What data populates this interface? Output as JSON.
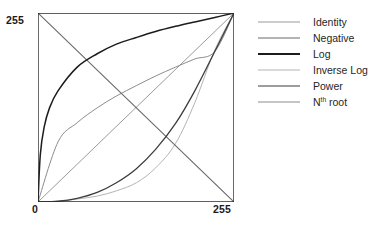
{
  "chart_data": {
    "type": "line",
    "title": "",
    "xlabel": "",
    "ylabel": "",
    "xlim": [
      0,
      255
    ],
    "ylim": [
      0,
      255
    ],
    "grid": false,
    "legend_position": "right",
    "x_ticks": [
      "0",
      "255"
    ],
    "y_ticks": [
      "255"
    ],
    "series": [
      {
        "name": "Identity",
        "color": "#9a9a9a",
        "width": 1.0,
        "formula": "y = x",
        "x": [
          0,
          26,
          51,
          77,
          102,
          128,
          153,
          179,
          204,
          230,
          255
        ],
        "y": [
          0,
          26,
          51,
          77,
          102,
          128,
          153,
          179,
          204,
          230,
          255
        ]
      },
      {
        "name": "Negative",
        "color": "#6b6b6b",
        "width": 1.1,
        "formula": "y = 255 - x",
        "x": [
          0,
          26,
          51,
          77,
          102,
          128,
          153,
          179,
          204,
          230,
          255
        ],
        "y": [
          255,
          230,
          204,
          179,
          153,
          128,
          102,
          77,
          51,
          26,
          0
        ]
      },
      {
        "name": "Log",
        "color": "#1c1c1c",
        "width": 1.5,
        "formula": "y = 255 * log(1 + x) / log(256)",
        "x": [
          0,
          3,
          8,
          15,
          26,
          51,
          77,
          102,
          128,
          153,
          179,
          204,
          230,
          255
        ],
        "y": [
          0,
          64,
          101,
          127,
          150,
          182,
          200,
          213,
          222,
          230,
          237,
          243,
          249,
          255
        ]
      },
      {
        "name": "Inverse Log",
        "color": "#b4b4b4",
        "width": 1.0,
        "formula": "y = 256^(x/255) - 1",
        "x": [
          0,
          26,
          51,
          77,
          102,
          128,
          153,
          179,
          204,
          230,
          255
        ],
        "y": [
          0,
          1,
          4,
          8,
          15,
          26,
          46,
          79,
          134,
          205,
          255
        ]
      },
      {
        "name": "Power",
        "color": "#3d3d3d",
        "width": 1.3,
        "formula": "y = 255 * (x/255)^2.5",
        "x": [
          0,
          26,
          51,
          77,
          102,
          128,
          153,
          179,
          204,
          230,
          255
        ],
        "y": [
          0,
          1,
          5,
          13,
          26,
          45,
          71,
          106,
          150,
          203,
          255
        ]
      },
      {
        "name": "Nth root",
        "label_main": "N",
        "label_sup": "th",
        "label_tail": " root",
        "color": "#8c8c8c",
        "width": 1.0,
        "formula": "y = 255 * (x/255)^(1/2.5)",
        "x": [
          0,
          26,
          51,
          77,
          102,
          128,
          153,
          179,
          204,
          230,
          255
        ],
        "y": [
          0,
          81,
          107,
          127,
          143,
          157,
          170,
          182,
          193,
          203,
          255
        ]
      }
    ]
  },
  "axes": {
    "y_max_label": "255",
    "x_min_label": "0",
    "x_max_label": "255",
    "frame_color": "#2b2b2b"
  },
  "legend": {
    "items": [
      {
        "label": "Identity"
      },
      {
        "label": "Negative"
      },
      {
        "label": "Log"
      },
      {
        "label": "Inverse Log"
      },
      {
        "label": "Power"
      },
      {
        "label": "N"
      }
    ],
    "nth_root": {
      "main": "N",
      "sup": "th",
      "tail": " root"
    }
  }
}
